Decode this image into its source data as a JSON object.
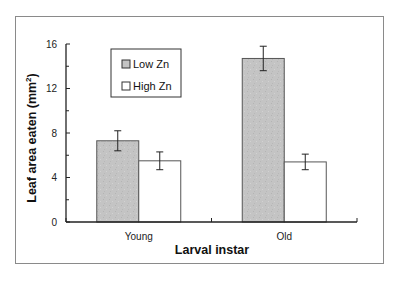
{
  "chart_data": {
    "type": "bar",
    "title": "",
    "xlabel": "Larval instar",
    "ylabel": "Leaf area eaten (mm2)",
    "ylabel_parts": {
      "main": "Leaf area eaten (mm",
      "sup": "2",
      "end": ")"
    },
    "categories": [
      "Young",
      "Old"
    ],
    "series": [
      {
        "name": "Low Zn",
        "color": "#c4c4c4",
        "values": [
          7.3,
          14.7
        ],
        "errors": [
          0.9,
          1.1
        ]
      },
      {
        "name": "High Zn",
        "color": "#ffffff",
        "values": [
          5.5,
          5.4
        ],
        "errors": [
          0.8,
          0.7
        ]
      }
    ],
    "ylim": [
      0,
      16
    ],
    "yticks": [
      0,
      4,
      8,
      12,
      16
    ],
    "yticks_minor": [
      2,
      6,
      10,
      14
    ],
    "grid": false,
    "legend_position": "upper-left inside plot"
  }
}
